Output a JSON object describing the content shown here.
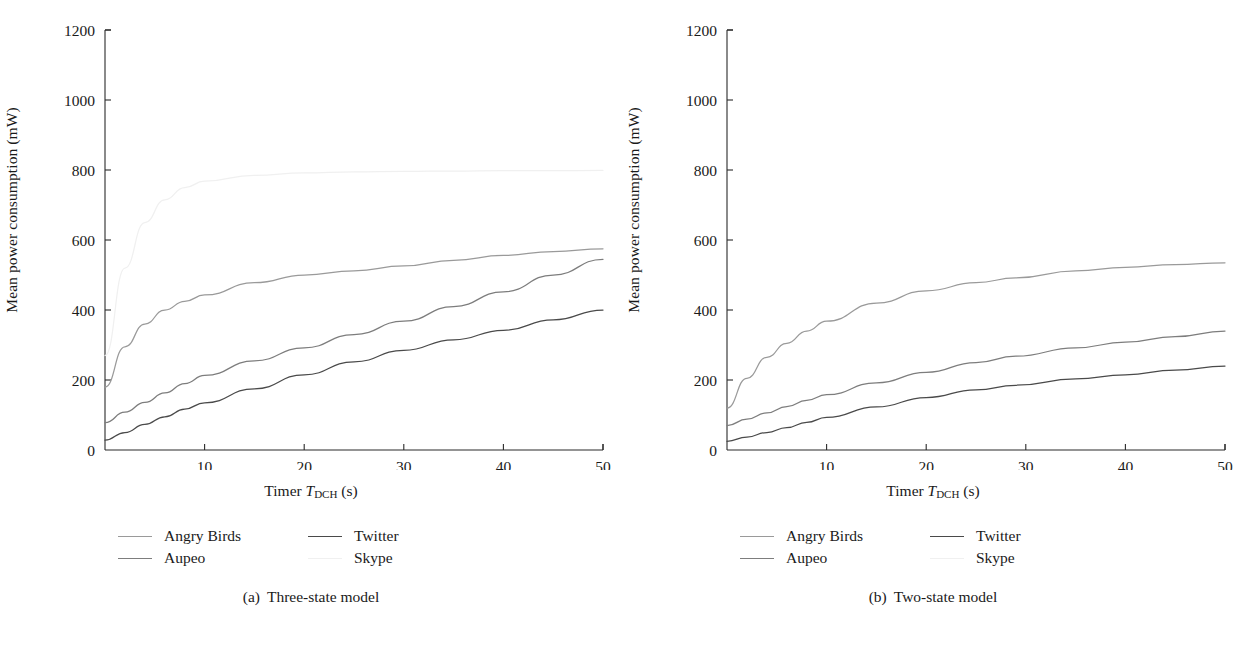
{
  "figure": {
    "panels": [
      {
        "id": "three-state",
        "caption_tag": "(a)",
        "caption_text": "Three-state model",
        "ylabel": "Mean power consumption (mW)",
        "xlabel_prefix": "Timer ",
        "xlabel_symbol": "T",
        "xlabel_sub": "DCH",
        "xlabel_unit": " (s)",
        "yticks": [
          "0",
          "200",
          "400",
          "600",
          "800",
          "1000",
          "1200"
        ],
        "xticks": [
          "10",
          "20",
          "30",
          "40",
          "50"
        ],
        "legend": [
          {
            "label": "Angry Birds",
            "color": "#9a9a9a"
          },
          {
            "label": "Twitter",
            "color": "#4a4a4a"
          },
          {
            "label": "Aupeo",
            "color": "#7d7d7d"
          },
          {
            "label": "Skype",
            "color": "#f0f0f0"
          }
        ]
      },
      {
        "id": "two-state",
        "caption_tag": "(b)",
        "caption_text": "Two-state model",
        "ylabel": "Mean power consumption (mW)",
        "xlabel_prefix": "Timer ",
        "xlabel_symbol": "T",
        "xlabel_sub": "DCH",
        "xlabel_unit": " (s)",
        "yticks": [
          "0",
          "200",
          "400",
          "600",
          "800",
          "1000",
          "1200"
        ],
        "xticks": [
          "10",
          "20",
          "30",
          "40",
          "50"
        ],
        "legend": [
          {
            "label": "Angry Birds",
            "color": "#9a9a9a"
          },
          {
            "label": "Twitter",
            "color": "#4a4a4a"
          },
          {
            "label": "Aupeo",
            "color": "#7d7d7d"
          },
          {
            "label": "Skype",
            "color": "#f0f0f0"
          }
        ]
      }
    ]
  },
  "chart_data": [
    {
      "type": "line",
      "title": "(a) Three-state model",
      "xlabel": "Timer T_DCH (s)",
      "ylabel": "Mean power consumption (mW)",
      "xlim": [
        0,
        50
      ],
      "ylim": [
        0,
        1200
      ],
      "xticks": [
        10,
        20,
        30,
        40,
        50
      ],
      "yticks": [
        0,
        200,
        400,
        600,
        800,
        1000,
        1200
      ],
      "grid": false,
      "legend_position": "below-left",
      "x": [
        0,
        2,
        4,
        6,
        8,
        10,
        15,
        20,
        25,
        30,
        35,
        40,
        45,
        50
      ],
      "series": [
        {
          "name": "Skype",
          "color": "#f0f0f0",
          "values": [
            270,
            520,
            650,
            715,
            750,
            768,
            785,
            792,
            795,
            796,
            797,
            798,
            798,
            799
          ]
        },
        {
          "name": "Angry Birds",
          "color": "#9a9a9a",
          "values": [
            180,
            295,
            360,
            400,
            425,
            443,
            478,
            500,
            512,
            526,
            542,
            556,
            567,
            575
          ]
        },
        {
          "name": "Aupeo",
          "color": "#7d7d7d",
          "values": [
            78,
            108,
            136,
            163,
            190,
            213,
            255,
            292,
            330,
            368,
            410,
            452,
            500,
            545
          ]
        },
        {
          "name": "Twitter",
          "color": "#4a4a4a",
          "values": [
            28,
            50,
            73,
            95,
            117,
            135,
            175,
            215,
            252,
            285,
            315,
            342,
            372,
            400
          ]
        }
      ]
    },
    {
      "type": "line",
      "title": "(b) Two-state model",
      "xlabel": "Timer T_DCH (s)",
      "ylabel": "Mean power consumption (mW)",
      "xlim": [
        0,
        50
      ],
      "ylim": [
        0,
        1200
      ],
      "xticks": [
        10,
        20,
        30,
        40,
        50
      ],
      "yticks": [
        0,
        200,
        400,
        600,
        800,
        1000,
        1200
      ],
      "grid": false,
      "legend_position": "below-left",
      "x": [
        0,
        2,
        4,
        6,
        8,
        10,
        15,
        20,
        25,
        29,
        35,
        40,
        45,
        50
      ],
      "series": [
        {
          "name": "Skype",
          "color": "#9a9a9a",
          "values": [
            120,
            205,
            265,
            305,
            340,
            368,
            420,
            455,
            478,
            492,
            512,
            522,
            530,
            535
          ]
        },
        {
          "name": "Aupeo",
          "color": "#7d7d7d",
          "values": [
            70,
            88,
            106,
            124,
            142,
            158,
            192,
            222,
            250,
            268,
            292,
            308,
            324,
            340
          ]
        },
        {
          "name": "Twitter",
          "color": "#4a4a4a",
          "values": [
            25,
            37,
            50,
            64,
            79,
            93,
            123,
            150,
            172,
            185,
            203,
            215,
            228,
            240
          ]
        }
      ]
    }
  ]
}
